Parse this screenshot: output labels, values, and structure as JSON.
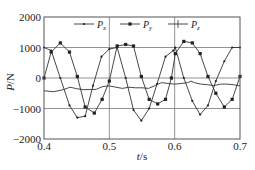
{
  "chart_data": {
    "type": "line",
    "title": "",
    "xlabel": "t/s",
    "ylabel": "P/N",
    "xlim": [
      0.4,
      0.7
    ],
    "ylim": [
      -2000,
      2000
    ],
    "xticks": [
      "0.4",
      "0.5",
      "0.6",
      "0.7"
    ],
    "yticks": [
      "2000",
      "1000",
      "0",
      "-1000",
      "-2000"
    ],
    "grid": true,
    "legend_position": "top-inside",
    "note": "Point values are approximate, read from a low-resolution image. The Px/Py marker assignment was not verified independently where the curves overlap.",
    "series": [
      {
        "name": "Px",
        "marker": "dot",
        "x": [
          0.4,
          0.411,
          0.425,
          0.439,
          0.451,
          0.463,
          0.475,
          0.488,
          0.5,
          0.512,
          0.525,
          0.537,
          0.549,
          0.561,
          0.573,
          0.586,
          0.598,
          0.601,
          0.614,
          0.627,
          0.639,
          0.651,
          0.663,
          0.676,
          0.688,
          0.7
        ],
        "y": [
          1000,
          900,
          0,
          -900,
          -1300,
          -1250,
          -250,
          700,
          950,
          1000,
          0,
          -1050,
          -1400,
          -1000,
          -200,
          700,
          900,
          1000,
          0,
          -750,
          -1200,
          -900,
          -100,
          550,
          1000,
          1000
        ]
      },
      {
        "name": "Py",
        "marker": "square",
        "x": [
          0.4,
          0.411,
          0.425,
          0.439,
          0.451,
          0.463,
          0.477,
          0.489,
          0.5,
          0.512,
          0.525,
          0.537,
          0.549,
          0.561,
          0.574,
          0.586,
          0.595,
          0.601,
          0.614,
          0.627,
          0.639,
          0.651,
          0.663,
          0.676,
          0.688,
          0.7
        ],
        "y": [
          0,
          850,
          1150,
          850,
          50,
          -950,
          -1150,
          -700,
          -100,
          1050,
          1100,
          1050,
          50,
          -700,
          -850,
          -700,
          0,
          800,
          1200,
          1150,
          800,
          50,
          -500,
          -950,
          -700,
          50
        ]
      },
      {
        "name": "Pz",
        "marker": "none",
        "x": [
          0.4,
          0.415,
          0.43,
          0.44,
          0.45,
          0.46,
          0.47,
          0.48,
          0.49,
          0.5,
          0.51,
          0.52,
          0.53,
          0.54,
          0.55,
          0.56,
          0.57,
          0.58,
          0.59,
          0.6,
          0.61,
          0.62,
          0.625,
          0.63,
          0.64,
          0.65,
          0.66,
          0.67,
          0.68,
          0.69,
          0.7
        ],
        "y": [
          -420,
          -450,
          -380,
          -300,
          -350,
          -380,
          -380,
          -370,
          -280,
          -260,
          -300,
          -340,
          -300,
          -320,
          -320,
          -340,
          -250,
          -150,
          -180,
          -200,
          -180,
          -150,
          -100,
          -150,
          -200,
          -220,
          -250,
          -200,
          -200,
          -220,
          -260
        ]
      }
    ]
  },
  "axes": {
    "xlabel_t": "t",
    "xlabel_unit": "/s",
    "ylabel_p": "P",
    "ylabel_unit": "/N"
  },
  "legend": [
    {
      "label": "P",
      "sub": "x"
    },
    {
      "label": "P",
      "sub": "y"
    },
    {
      "label": "P",
      "sub": "z"
    }
  ]
}
